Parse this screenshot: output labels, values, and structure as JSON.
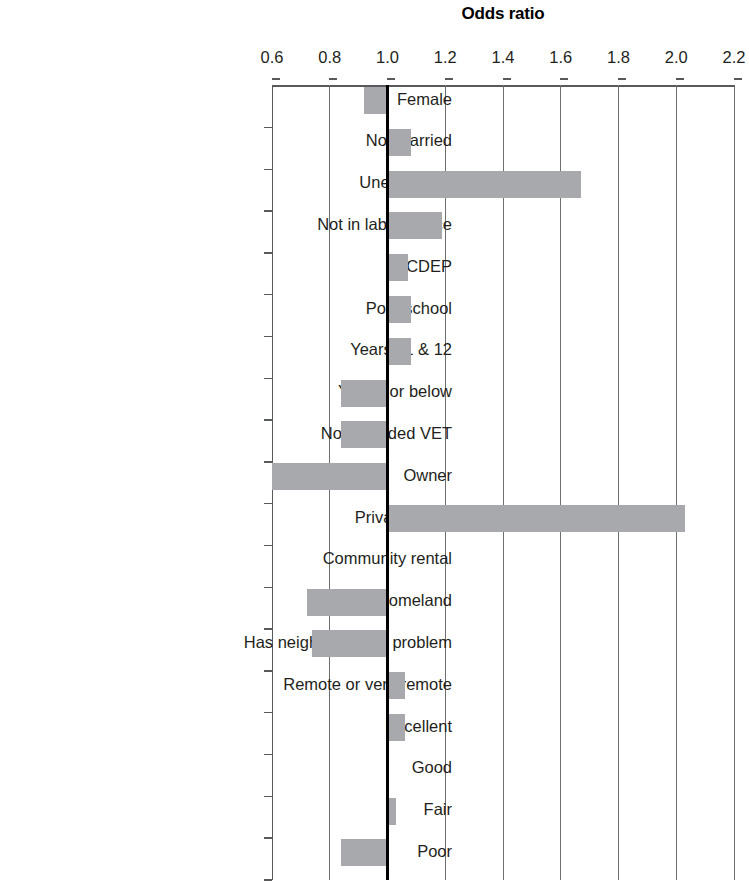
{
  "chart_data": {
    "type": "bar",
    "orientation": "horizontal",
    "title": "Odds ratio",
    "xlabel": "",
    "ylabel": "",
    "xlim": [
      0.6,
      2.2
    ],
    "xticks": [
      "0.6",
      "0.8",
      "1.0",
      "1.2",
      "1.4",
      "1.6",
      "1.8",
      "2.0",
      "2.2"
    ],
    "xtick_values": [
      0.6,
      0.8,
      1.0,
      1.2,
      1.4,
      1.6,
      1.8,
      2.0,
      2.2
    ],
    "grid": true,
    "legend": null,
    "reference_line": 1.0,
    "baseline": 1.0,
    "bar_color": "#a7a9ac",
    "axis_color": "#58595b",
    "gridline_color": "#6d6e71",
    "reference_line_color": "#000000",
    "categories": [
      "Female",
      "Not married",
      "Unemployed",
      "Not in labour force",
      "CDEP",
      "Post-school",
      "Years 11 & 12",
      "Year 9 or below",
      "Not attended VET",
      "Owner",
      "Private rental",
      "Community rental",
      "Live in homeland",
      "Has neighbourhood problem",
      "Remote or very remote",
      "Excellent",
      "Good",
      "Fair",
      "Poor"
    ],
    "values": [
      0.92,
      1.08,
      1.67,
      1.19,
      1.07,
      1.08,
      1.08,
      0.84,
      0.84,
      0.58,
      2.03,
      1.0,
      0.72,
      0.74,
      1.06,
      1.06,
      1.0,
      1.03,
      0.84
    ]
  }
}
